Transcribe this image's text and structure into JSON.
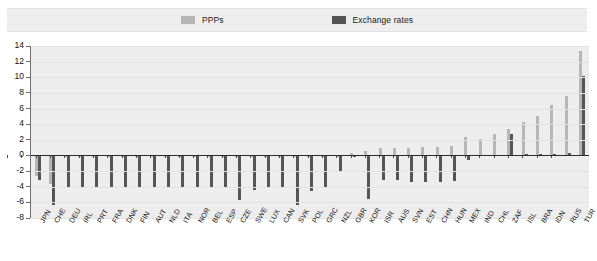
{
  "legend": {
    "items": [
      {
        "label": "PPPs",
        "color": "#b6b6b6",
        "icon": "square-swatch-icon"
      },
      {
        "label": "Exchange rates",
        "color": "#555555",
        "icon": "square-swatch-icon"
      }
    ]
  },
  "chart_data": {
    "type": "bar",
    "title": "",
    "subtitle": "",
    "xlabel": "",
    "ylabel": "",
    "ylim": [
      -8,
      14
    ],
    "yticks": [
      -8,
      -6,
      -4,
      -2,
      0,
      2,
      4,
      6,
      8,
      10,
      12,
      14
    ],
    "grid": true,
    "legend_position": "top-center",
    "orientation": "vertical",
    "zero_line": 0,
    "categories": [
      "JPN",
      "CHE",
      "DEU",
      "IRL",
      "PRT",
      "FRA",
      "DNK",
      "FIN",
      "AUT",
      "NLD",
      "ITA",
      "NOR",
      "BEL",
      "ESP",
      "CZE",
      "SWE",
      "LUX",
      "CAN",
      "SVK",
      "POL",
      "GRC",
      "NZL",
      "GBR",
      "KOR",
      "ISR",
      "AUS",
      "SVN",
      "EST",
      "CHN",
      "HUN",
      "MEX",
      "IND",
      "CHL",
      "ZAF",
      "ISL",
      "BRA",
      "IDN",
      "RUS",
      "TUR"
    ],
    "series": [
      {
        "name": "PPPs",
        "color": "#b6b6b6",
        "values": [
          -2.6,
          -3.6,
          -0.2,
          -0.2,
          -0.2,
          -0.2,
          -0.2,
          -0.2,
          -0.2,
          -0.2,
          -0.2,
          -0.2,
          -0.2,
          -0.2,
          -0.2,
          -0.2,
          -0.2,
          -0.2,
          -0.2,
          -0.2,
          -0.2,
          -0.2,
          0.3,
          0.6,
          0.9,
          1.0,
          1.0,
          1.1,
          1.1,
          1.2,
          2.3,
          2.1,
          2.7,
          3.4,
          4.3,
          5.1,
          6.5,
          7.6,
          13.4
        ]
      },
      {
        "name": "Exchange rates",
        "color": "#555555",
        "values": [
          -3.1,
          -6.3,
          -4.1,
          -4.0,
          -4.1,
          -4.1,
          -4.1,
          -4.1,
          -4.1,
          -4.1,
          -4.1,
          -4.1,
          -4.1,
          -4.1,
          -5.7,
          -4.4,
          -4.1,
          -4.1,
          -6.3,
          -4.6,
          -4.1,
          -2.1,
          -0.2,
          -5.6,
          -3.2,
          -3.2,
          -3.4,
          -3.4,
          -3.4,
          -3.3,
          -0.6,
          0.1,
          0.1,
          2.8,
          0.2,
          0.2,
          0.2,
          0.3,
          10.2
        ]
      }
    ]
  }
}
